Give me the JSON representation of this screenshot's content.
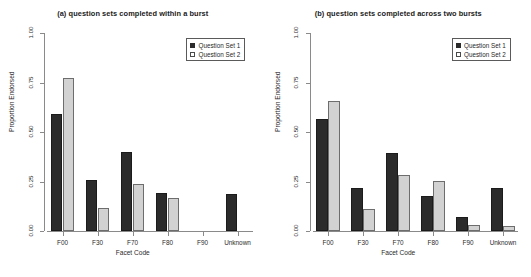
{
  "figure": {
    "ylabel": "Proportion Endorsed",
    "xlabel": "Facet Code",
    "legend_entries": [
      "Question Set 1",
      "Question Set 2"
    ],
    "series_colors": [
      "#2b2b2b",
      "#d2d2d2"
    ],
    "y_ticks": [
      "0.00",
      "0.25",
      "0.50",
      "0.75",
      "1.00"
    ],
    "categories": [
      "F00",
      "F30",
      "F70",
      "F80",
      "F90",
      "Unknown"
    ]
  },
  "chart_data": [
    {
      "type": "bar",
      "title": "(a) question sets completed within a burst",
      "xlabel": "Facet Code",
      "ylabel": "Proportion Endorsed",
      "ylim": [
        0.0,
        1.0
      ],
      "yticks": [
        0.0,
        0.25,
        0.5,
        0.75,
        1.0
      ],
      "ytick_labels": [
        "0.00",
        "0.25",
        "0.50",
        "0.75",
        "1.00"
      ],
      "grid": false,
      "legend_position": "top-right",
      "categories": [
        "F00",
        "F30",
        "F70",
        "F80",
        "F90",
        "Unknown"
      ],
      "series": [
        {
          "name": "Question Set 1",
          "color": "#2b2b2b",
          "values": [
            0.59,
            0.26,
            0.4,
            0.19,
            0.0,
            0.185
          ]
        },
        {
          "name": "Question Set 2",
          "color": "#d2d2d2",
          "values": [
            0.775,
            0.115,
            0.235,
            0.165,
            0.0,
            0.0
          ]
        }
      ]
    },
    {
      "type": "bar",
      "title": "(b) question sets completed across two bursts",
      "xlabel": "Facet Code",
      "ylabel": "Proportion Endorsed",
      "ylim": [
        0.0,
        1.0
      ],
      "yticks": [
        0.0,
        0.25,
        0.5,
        0.75,
        1.0
      ],
      "ytick_labels": [
        "0.00",
        "0.25",
        "0.50",
        "0.75",
        "1.00"
      ],
      "grid": false,
      "legend_position": "top-right",
      "categories": [
        "F00",
        "F30",
        "F70",
        "F80",
        "F90",
        "Unknown"
      ],
      "series": [
        {
          "name": "Question Set 1",
          "color": "#2b2b2b",
          "values": [
            0.565,
            0.215,
            0.395,
            0.175,
            0.07,
            0.215
          ]
        },
        {
          "name": "Question Set 2",
          "color": "#d2d2d2",
          "values": [
            0.655,
            0.11,
            0.285,
            0.255,
            0.03,
            0.025
          ]
        }
      ]
    }
  ]
}
